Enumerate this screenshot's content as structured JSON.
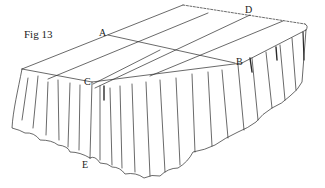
{
  "figure": {
    "title": "Fig 13",
    "stroke_color": "#2a2a2a",
    "labels": [
      {
        "id": "A",
        "text": "A",
        "x": 99,
        "y": 28
      },
      {
        "id": "B",
        "text": "B",
        "x": 236,
        "y": 57
      },
      {
        "id": "C",
        "text": "C",
        "x": 84,
        "y": 77
      },
      {
        "id": "D",
        "text": "D",
        "x": 245,
        "y": 5
      },
      {
        "id": "E",
        "text": "E",
        "x": 82,
        "y": 160
      }
    ]
  }
}
